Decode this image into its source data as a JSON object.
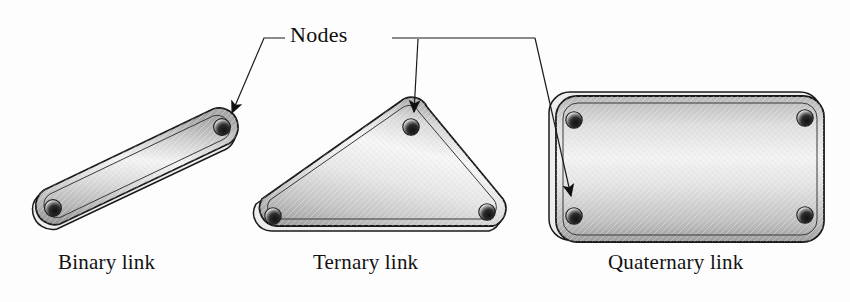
{
  "figure": {
    "background_color": "#fdfdfd",
    "line_color": "#1a1a1a",
    "body_light": "#f2f2f2",
    "body_mid": "#c9c9c9",
    "body_dark": "#9a9a9a"
  },
  "annotation": {
    "nodes_label": "Nodes",
    "leader_count": 3
  },
  "links": [
    {
      "id": "binary",
      "caption": "Binary link",
      "node_count": 2,
      "shape": "elongated-rounded-bar",
      "nodes": [
        {
          "cx": 53,
          "cy": 208
        },
        {
          "cx": 222,
          "cy": 127
        }
      ]
    },
    {
      "id": "ternary",
      "caption": "Ternary link",
      "node_count": 3,
      "shape": "rounded-triangle",
      "nodes": [
        {
          "cx": 273,
          "cy": 216
        },
        {
          "cx": 411,
          "cy": 127
        },
        {
          "cx": 487,
          "cy": 212
        }
      ]
    },
    {
      "id": "quaternary",
      "caption": "Quaternary link",
      "node_count": 4,
      "shape": "rounded-rectangle",
      "nodes": [
        {
          "cx": 574,
          "cy": 120
        },
        {
          "cx": 805,
          "cy": 118
        },
        {
          "cx": 574,
          "cy": 216
        },
        {
          "cx": 805,
          "cy": 215
        }
      ]
    }
  ]
}
